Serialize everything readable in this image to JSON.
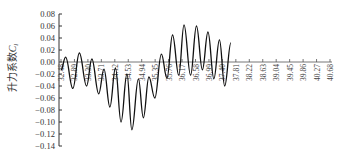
{
  "chart_data": {
    "type": "line",
    "title": "",
    "xlabel": "",
    "ylabel": "升力系数C_l",
    "ylabel_main": "升力系数",
    "ylabel_symbol": "C",
    "ylabel_subscript": "l",
    "ylim": [
      -0.14,
      0.08
    ],
    "yticks": [
      "0.08",
      "0.06",
      "0.04",
      "0.02",
      "0.00",
      "−0.02",
      "−0.04",
      "−0.06",
      "−0.08",
      "−0.10",
      "−0.12",
      "−0.14"
    ],
    "ytick_values": [
      0.08,
      0.06,
      0.04,
      0.02,
      0.0,
      -0.02,
      -0.04,
      -0.06,
      -0.08,
      -0.1,
      -0.12,
      -0.14
    ],
    "xticks": [
      "32.48",
      "32.89",
      "33.30",
      "33.71",
      "34.12",
      "34.53",
      "34.94",
      "35.35",
      "35.76",
      "36.17",
      "36.58",
      "36.99",
      "37.40",
      "37.81",
      "38.22",
      "38.63",
      "39.04",
      "39.45",
      "39.86",
      "40.27",
      "40.68"
    ],
    "xlim": [
      32.48,
      40.68
    ],
    "grid": false,
    "legend": null,
    "series": [
      {
        "name": "升力系数",
        "color": "#111111",
        "x": [
          32.48,
          32.62,
          32.84,
          33.04,
          33.26,
          33.42,
          33.63,
          33.79,
          33.97,
          34.14,
          34.31,
          34.49,
          34.64,
          34.84,
          34.99,
          35.16,
          35.34,
          35.54,
          35.71,
          35.88,
          36.07,
          36.23,
          36.43,
          36.61,
          36.79,
          36.96,
          37.14,
          37.31,
          37.47,
          37.66
        ],
        "values": [
          -0.013,
          0.008,
          -0.044,
          0.015,
          -0.04,
          0.005,
          -0.053,
          -0.012,
          -0.075,
          -0.01,
          -0.1,
          -0.02,
          -0.113,
          -0.028,
          -0.093,
          -0.025,
          -0.06,
          0.013,
          -0.027,
          0.045,
          -0.022,
          0.062,
          -0.022,
          0.06,
          -0.013,
          0.05,
          -0.028,
          0.037,
          -0.04,
          0.032
        ]
      }
    ]
  }
}
